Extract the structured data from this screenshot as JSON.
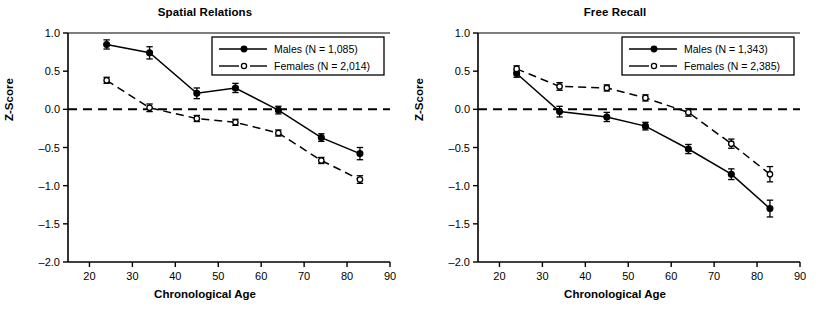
{
  "figure": {
    "background": "#ffffff",
    "ink": "#000000"
  },
  "chart_data": [
    {
      "type": "line",
      "title": "Spatial Relations",
      "xlabel": "Chronological Age",
      "ylabel": "Z-Score",
      "xlim": [
        15,
        90
      ],
      "ylim": [
        -2.0,
        1.0
      ],
      "xticks": [
        20,
        30,
        40,
        50,
        60,
        70,
        80,
        90
      ],
      "yticks": [
        1.0,
        0.5,
        0.0,
        -0.5,
        -1.0,
        -1.5,
        -2.0
      ],
      "xticklabels": [
        "20",
        "30",
        "40",
        "50",
        "60",
        "70",
        "80",
        "90"
      ],
      "yticklabels": [
        "1.0",
        "0.5",
        "0.0",
        "-0.5",
        "-1.0",
        "-1.5",
        "-2.0"
      ],
      "grid": false,
      "zero_reference_line": {
        "y": 0.0,
        "style": "dashed"
      },
      "legend_position": "upper right",
      "x": [
        24,
        34,
        45,
        54,
        64,
        74,
        83
      ],
      "series": [
        {
          "name": "Males (N = 1,085)",
          "marker": "filled-circle",
          "linestyle": "solid",
          "values": [
            0.85,
            0.74,
            0.21,
            0.28,
            -0.01,
            -0.37,
            -0.58
          ],
          "errors": [
            0.06,
            0.08,
            0.07,
            0.06,
            0.05,
            0.05,
            0.08
          ]
        },
        {
          "name": "Females (N = 2,014)",
          "marker": "open-circle",
          "linestyle": "dashed",
          "values": [
            0.38,
            0.02,
            -0.12,
            -0.17,
            -0.31,
            -0.67,
            -0.92
          ],
          "errors": [
            0.04,
            0.05,
            0.04,
            0.04,
            0.04,
            0.04,
            0.05
          ]
        }
      ]
    },
    {
      "type": "line",
      "title": "Free Recall",
      "xlabel": "Chronological Age",
      "ylabel": "Z-Score",
      "xlim": [
        15,
        90
      ],
      "ylim": [
        -2.0,
        1.0
      ],
      "xticks": [
        20,
        30,
        40,
        50,
        60,
        70,
        80,
        90
      ],
      "yticks": [
        1.0,
        0.5,
        0.0,
        -0.5,
        -1.0,
        -1.5,
        -2.0
      ],
      "xticklabels": [
        "20",
        "30",
        "40",
        "50",
        "60",
        "70",
        "80",
        "90"
      ],
      "yticklabels": [
        "1.0",
        "0.5",
        "0.0",
        "-0.5",
        "-1.0",
        "-1.5",
        "-2.0"
      ],
      "grid": false,
      "zero_reference_line": {
        "y": 0.0,
        "style": "dashed"
      },
      "legend_position": "upper right",
      "x": [
        24,
        34,
        45,
        54,
        64,
        74,
        83
      ],
      "series": [
        {
          "name": "Males (N = 1,343)",
          "marker": "filled-circle",
          "linestyle": "solid",
          "values": [
            0.47,
            -0.03,
            -0.1,
            -0.22,
            -0.52,
            -0.85,
            -1.3
          ],
          "errors": [
            0.05,
            0.07,
            0.06,
            0.05,
            0.06,
            0.07,
            0.11
          ]
        },
        {
          "name": "Females (N = 2,385)",
          "marker": "open-circle",
          "linestyle": "dashed",
          "values": [
            0.53,
            0.3,
            0.28,
            0.15,
            -0.04,
            -0.45,
            -0.85
          ],
          "errors": [
            0.04,
            0.05,
            0.04,
            0.04,
            0.05,
            0.06,
            0.1
          ]
        }
      ]
    }
  ]
}
